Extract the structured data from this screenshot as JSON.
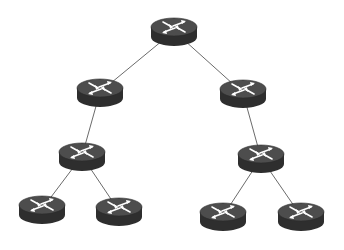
{
  "diagram": {
    "type": "network-topology-tree",
    "background": "#ffffff",
    "link_color": "#6b6b6b",
    "router_colors": {
      "top": "#4a4a4a",
      "side": "#2e2e2e",
      "arrow": "#ffffff"
    },
    "nodes": [
      {
        "id": "root",
        "icon": "router-icon",
        "x": 174,
        "y": 31
      },
      {
        "id": "l1-left",
        "icon": "router-icon",
        "x": 100,
        "y": 92
      },
      {
        "id": "l1-right",
        "icon": "router-icon",
        "x": 243,
        "y": 93
      },
      {
        "id": "l2-left",
        "icon": "router-icon",
        "x": 82,
        "y": 156
      },
      {
        "id": "l2-right",
        "icon": "router-icon",
        "x": 261,
        "y": 158
      },
      {
        "id": "leaf-1",
        "icon": "router-icon",
        "x": 42,
        "y": 209
      },
      {
        "id": "leaf-2",
        "icon": "router-icon",
        "x": 119,
        "y": 211
      },
      {
        "id": "leaf-3",
        "icon": "router-icon",
        "x": 223,
        "y": 216
      },
      {
        "id": "leaf-4",
        "icon": "router-icon",
        "x": 301,
        "y": 216
      }
    ],
    "links": [
      [
        "root",
        "l1-left"
      ],
      [
        "root",
        "l1-right"
      ],
      [
        "l1-left",
        "l2-left"
      ],
      [
        "l1-right",
        "l2-right"
      ],
      [
        "l2-left",
        "leaf-1"
      ],
      [
        "l2-left",
        "leaf-2"
      ],
      [
        "l2-right",
        "leaf-3"
      ],
      [
        "l2-right",
        "leaf-4"
      ]
    ]
  }
}
